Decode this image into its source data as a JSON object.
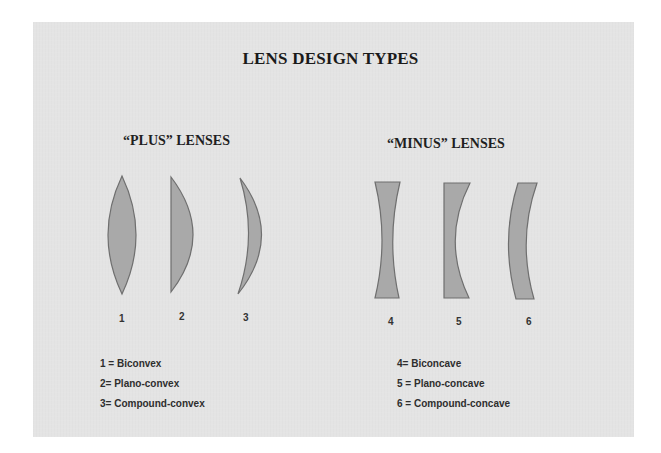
{
  "title": "LENS DESIGN TYPES",
  "plus_group": {
    "heading": "“PLUS” LENSES",
    "lenses": [
      {
        "number": "1",
        "name": "Biconvex",
        "legend": "1 = Biconvex"
      },
      {
        "number": "2",
        "name": "Plano-convex",
        "legend": "2= Plano-convex"
      },
      {
        "number": "3",
        "name": "Compound-convex",
        "legend": "3= Compound-convex"
      }
    ]
  },
  "minus_group": {
    "heading": "“MINUS” LENSES",
    "lenses": [
      {
        "number": "4",
        "name": "Biconcave",
        "legend": "4= Biconcave"
      },
      {
        "number": "5",
        "name": "Plano-concave",
        "legend": "5 = Plano-concave"
      },
      {
        "number": "6",
        "name": "Compound-concave",
        "legend": "6 = Compound-concave"
      }
    ]
  },
  "colors": {
    "background": "#e4e4e4",
    "lens_fill": "#a9a9a9",
    "lens_stroke": "#6f6f6f"
  }
}
